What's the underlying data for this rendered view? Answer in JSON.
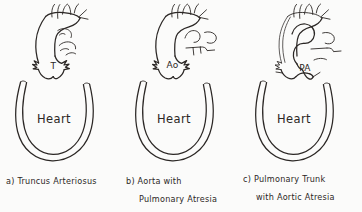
{
  "figure": {
    "kind": "line-diagram",
    "background_color": "#fbfbfa",
    "ink_color": "#2b2725",
    "panel_count": 3
  },
  "panels": [
    {
      "id": "a",
      "heart_label": "Heart",
      "vessel_label": "T",
      "caption_line1": "a) Truncus Arteriosus",
      "caption_line2": "",
      "vessel_label_name": "truncus",
      "description": "single common arterial trunk arising from heart"
    },
    {
      "id": "b",
      "heart_label": "Heart",
      "vessel_label": "Ao",
      "caption_line1": "b) Aorta with",
      "caption_line2": "Pulmonary Atresia",
      "vessel_label_name": "aorta",
      "description": "aorta from heart, pulmonary artery atretic and detached"
    },
    {
      "id": "c",
      "heart_label": "Heart",
      "vessel_label": "PA",
      "caption_line1": "c) Pulmonary Trunk",
      "caption_line2": "with Aortic Atresia",
      "vessel_label_name": "pulmonary-trunk",
      "description": "pulmonary trunk from heart, aorta atretic and thread-like"
    }
  ]
}
